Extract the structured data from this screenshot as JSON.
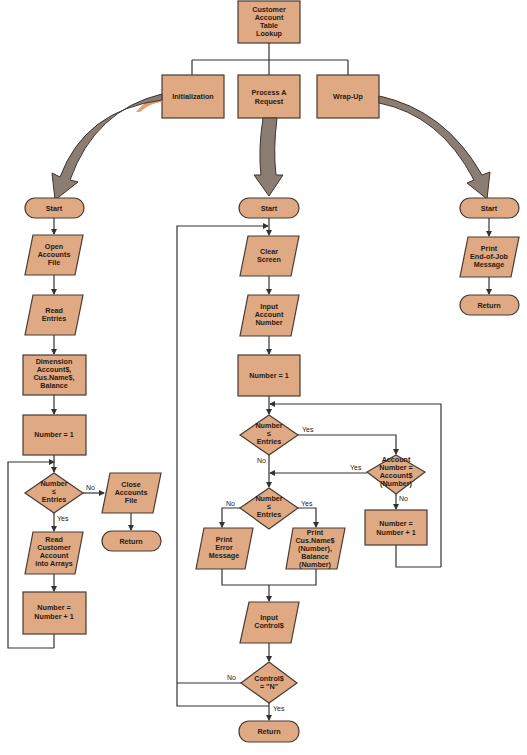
{
  "title": "Customer Account Table Lookup",
  "colors": {
    "box_fill": "#dfa984",
    "box_stroke": "#4a3a30",
    "arrow_fill": "#8c7d72",
    "line": "#333333"
  },
  "top": {
    "root": [
      "Customer",
      "Account",
      "Table",
      "Lookup"
    ],
    "modules": [
      {
        "id": "init",
        "lines": [
          "Initialization"
        ]
      },
      {
        "id": "process",
        "lines": [
          "Process A",
          "Request"
        ]
      },
      {
        "id": "wrapup",
        "lines": [
          "Wrap-Up"
        ]
      }
    ]
  },
  "init_flow": {
    "start": "Start",
    "open": [
      "Open",
      "Accounts",
      "File"
    ],
    "read": [
      "Read",
      "Entries"
    ],
    "dim": [
      "Dimension",
      "Account$,",
      "Cus.Name$,",
      "Balance"
    ],
    "number1": "Number  =  1",
    "decision": [
      "Number",
      "≤",
      "Entries"
    ],
    "no": "No",
    "yes": "Yes",
    "close": [
      "Close",
      "Accounts",
      "File"
    ],
    "return": "Return",
    "readcust": [
      "Read",
      "Customer",
      "Account",
      "into Arrays"
    ],
    "incr": [
      "Number  =",
      "Number  +  1"
    ]
  },
  "process_flow": {
    "start": "Start",
    "clear": [
      "Clear",
      "Screen"
    ],
    "input_acct": [
      "Input",
      "Account",
      "Number"
    ],
    "number1": "Number  =  1",
    "dec1": [
      "Number",
      "≤",
      "Entries"
    ],
    "dec1_yes": "Yes",
    "dec1_no": "No",
    "dec2": [
      "Account",
      "Number  =",
      "Account$",
      "(Number)"
    ],
    "dec2_yes": "Yes",
    "dec2_no": "No",
    "incr": [
      "Number  =",
      "Number  +  1"
    ],
    "dec3": [
      "Number",
      "≤",
      "Entries"
    ],
    "dec3_yes": "Yes",
    "dec3_no": "No",
    "err": [
      "Print",
      "Error",
      "Message"
    ],
    "print": [
      "Print",
      "Cus.Name$",
      "(Number),",
      "Balance",
      "(Number)"
    ],
    "input_ctrl": [
      "Input",
      "Control$"
    ],
    "dec4": [
      "Control$",
      "=  \"N\""
    ],
    "dec4_yes": "Yes",
    "dec4_no": "No",
    "return": "Return"
  },
  "wrap_flow": {
    "start": "Start",
    "print": [
      "Print",
      "End-of-Job",
      "Message"
    ],
    "return": "Return"
  }
}
